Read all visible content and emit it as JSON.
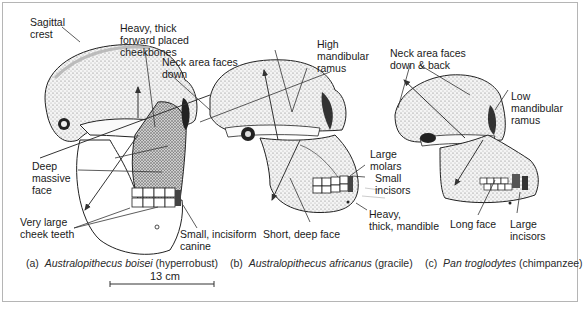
{
  "figure": {
    "skulls": [
      {
        "id": "a",
        "caption_prefix": "(a)",
        "species": "Australopithecus boisei",
        "descriptor": "(hyperrobust)",
        "labels": [
          "Sagittal\ncrest",
          "Heavy, thick\nforward placed\ncheekbones",
          "Neck area faces\ndown",
          "Deep\nmassive\nface",
          "Very large\ncheek teeth",
          "Small, incisiform\ncanine"
        ]
      },
      {
        "id": "b",
        "caption_prefix": "(b)",
        "species": "Australopithecus africanus",
        "descriptor": "(gracile)",
        "labels": [
          "High\nmandibular\nramus",
          "Large\nmolars",
          "Small\nincisors",
          "Heavy,\nthick, mandible",
          "Short, deep face"
        ]
      },
      {
        "id": "c",
        "caption_prefix": "(c)",
        "species": "Pan troglodytes",
        "descriptor": "(chimpanzee)",
        "labels": [
          "Neck area faces\ndown & back",
          "Low\nmandibular\nramus",
          "Long face",
          "Large\nincisors"
        ]
      }
    ],
    "scale_bar": {
      "label": "13 cm"
    }
  }
}
